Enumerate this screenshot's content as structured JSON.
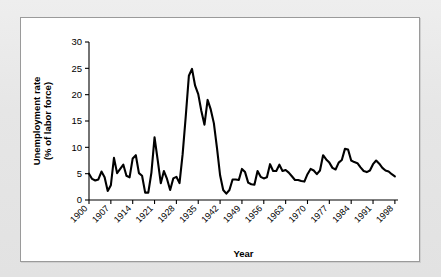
{
  "figure": {
    "background_color": "#e8e8e8",
    "panel_color": "#ffffff",
    "panel_border_color": "#9a9a9a",
    "line_color": "#000000"
  },
  "labels": {
    "ylabel_line1": "Unemployment rate",
    "ylabel_line2": "(% of labor force)",
    "xlabel": "Year"
  },
  "chart_data": {
    "type": "line",
    "title": "",
    "subtitle": "",
    "xlabel": "Year",
    "ylabel": "Unemployment rate (% of labor force)",
    "xlim": [
      1900,
      1999
    ],
    "ylim": [
      0,
      30
    ],
    "ytick_labels": [
      "0",
      "5",
      "10",
      "15",
      "20",
      "25",
      "30"
    ],
    "yticks": [
      0,
      5,
      10,
      15,
      20,
      25,
      30
    ],
    "xtick_labels": [
      "1900",
      "1907",
      "1914",
      "1921",
      "1928",
      "1935",
      "1942",
      "1949",
      "1956",
      "1963",
      "1970",
      "1977",
      "1984",
      "1991",
      "1998"
    ],
    "xticks": [
      1900,
      1907,
      1914,
      1921,
      1928,
      1935,
      1942,
      1949,
      1956,
      1963,
      1970,
      1977,
      1984,
      1991,
      1998
    ],
    "xtick_rotation_deg": 45,
    "grid": false,
    "legend": false,
    "legend_position": "none",
    "series": [
      {
        "name": "Unemployment rate",
        "color": "#000000",
        "x": [
          1900,
          1901,
          1902,
          1903,
          1904,
          1905,
          1906,
          1907,
          1908,
          1909,
          1910,
          1911,
          1912,
          1913,
          1914,
          1915,
          1916,
          1917,
          1918,
          1919,
          1920,
          1921,
          1922,
          1923,
          1924,
          1925,
          1926,
          1927,
          1928,
          1929,
          1930,
          1931,
          1932,
          1933,
          1934,
          1935,
          1936,
          1937,
          1938,
          1939,
          1940,
          1941,
          1942,
          1943,
          1944,
          1945,
          1946,
          1947,
          1948,
          1949,
          1950,
          1951,
          1952,
          1953,
          1954,
          1955,
          1956,
          1957,
          1958,
          1959,
          1960,
          1961,
          1962,
          1963,
          1964,
          1965,
          1966,
          1967,
          1968,
          1969,
          1970,
          1971,
          1972,
          1973,
          1974,
          1975,
          1976,
          1977,
          1978,
          1979,
          1980,
          1981,
          1982,
          1983,
          1984,
          1985,
          1986,
          1987,
          1988,
          1989,
          1990,
          1991,
          1992,
          1993,
          1994,
          1995,
          1996,
          1997,
          1998
        ],
        "y": [
          5.0,
          4.0,
          3.7,
          3.9,
          5.4,
          4.3,
          1.7,
          2.8,
          8.0,
          5.1,
          5.9,
          6.7,
          4.6,
          4.3,
          7.9,
          8.5,
          5.1,
          4.6,
          1.4,
          1.4,
          5.2,
          11.9,
          7.6,
          3.2,
          5.5,
          4.0,
          1.9,
          4.1,
          4.4,
          3.2,
          8.7,
          15.9,
          23.6,
          24.9,
          21.7,
          20.1,
          16.9,
          14.3,
          19.0,
          17.2,
          14.6,
          9.9,
          4.7,
          1.9,
          1.2,
          1.9,
          3.9,
          3.9,
          3.8,
          5.9,
          5.3,
          3.3,
          3.0,
          2.9,
          5.5,
          4.4,
          4.1,
          4.3,
          6.8,
          5.5,
          5.5,
          6.7,
          5.5,
          5.7,
          5.2,
          4.5,
          3.8,
          3.8,
          3.6,
          3.5,
          4.9,
          5.9,
          5.6,
          4.9,
          5.6,
          8.5,
          7.7,
          7.1,
          6.1,
          5.8,
          7.1,
          7.6,
          9.7,
          9.6,
          7.5,
          7.2,
          7.0,
          6.2,
          5.5,
          5.3,
          5.6,
          6.8,
          7.5,
          6.9,
          6.1,
          5.6,
          5.4,
          4.9,
          4.5
        ]
      }
    ]
  }
}
